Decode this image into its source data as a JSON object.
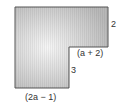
{
  "diagram": {
    "type": "L-shaped figure",
    "fill_gradient": {
      "center": "#f4f4f4",
      "edge": "#bdbdbd"
    },
    "stroke_color": "#555555",
    "vertices": [
      [
        15,
        7
      ],
      [
        108,
        7
      ],
      [
        108,
        47
      ],
      [
        69,
        47
      ],
      [
        69,
        88
      ],
      [
        15,
        88
      ]
    ],
    "labels": {
      "right_height": "2",
      "notch_width": "(a + 2)",
      "notch_height": "3",
      "bottom_width": "(2a − 1)"
    }
  }
}
